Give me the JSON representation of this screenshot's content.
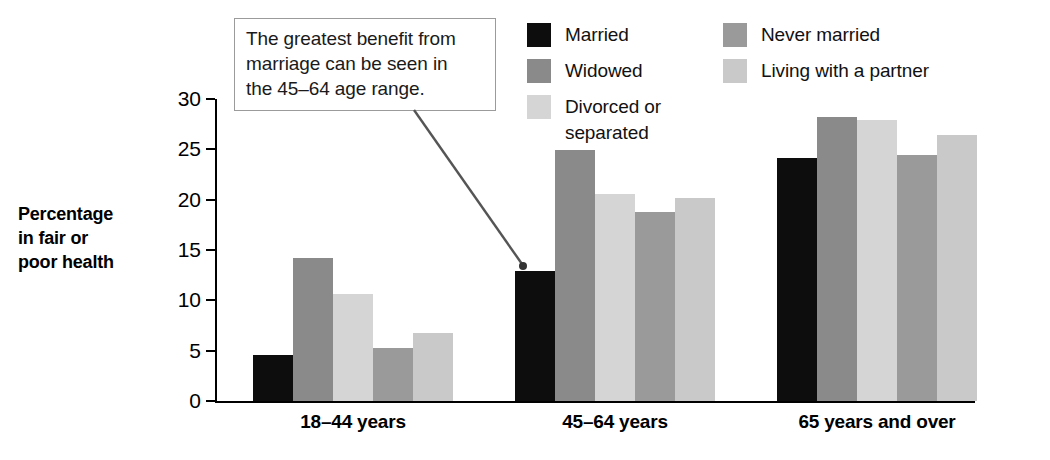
{
  "annotation": {
    "lines": [
      "The greatest benefit from",
      "marriage can be seen in",
      "the 45–64 age range."
    ],
    "arrow_target": "married-bar-45-64"
  },
  "axis": {
    "y_title_lines": [
      "Percentage",
      "in fair or",
      "poor health"
    ]
  },
  "chart_data": {
    "type": "bar",
    "title": "",
    "subtitle": "",
    "xlabel": "",
    "ylabel": "Percentage in fair or poor health",
    "categories": [
      "18–44 years",
      "45–64 years",
      "65 years and over"
    ],
    "series": [
      {
        "name": "Married",
        "color": "#0d0d0d",
        "values": [
          4.6,
          12.9,
          24.1
        ]
      },
      {
        "name": "Widowed",
        "color": "#8a8a8a",
        "values": [
          14.2,
          24.9,
          28.2
        ]
      },
      {
        "name": "Divorced or\nseparated",
        "color": "#d5d5d5",
        "values": [
          10.6,
          20.6,
          27.9
        ]
      },
      {
        "name": "Never married",
        "color": "#9a9a9a",
        "values": [
          5.3,
          18.8,
          24.4
        ]
      },
      {
        "name": "Living with a partner",
        "color": "#c9c9c9",
        "values": [
          6.8,
          20.2,
          26.4
        ]
      }
    ],
    "ylim": [
      0,
      30
    ],
    "yticks": [
      0,
      5,
      10,
      15,
      20,
      25,
      30
    ],
    "ytick_labels": [
      "0",
      "5",
      "10",
      "15",
      "20",
      "25",
      "30"
    ],
    "grid": false,
    "legend_position": "top-right",
    "legend_columns": 2
  }
}
